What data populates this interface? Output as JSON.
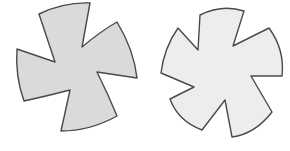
{
  "figure": {
    "width": 290,
    "height": 151,
    "background": "#ffffff",
    "stroke_color": "#4a4a4a",
    "stroke_width": 1.4
  },
  "shapes": [
    {
      "name": "four-arm-pinwheel",
      "arms": 4,
      "fill": "#dadada",
      "path": "M39,14 Q64,2 90,3 L82,47 Q101,31 117,22 Q134,50 137,78 L97,72 Q108,94 117,116 Q90,131 61,131 L70,90 Q47,96 24,101 Q15,76 17,49 L55,62 Z"
    },
    {
      "name": "five-arm-pinwheel",
      "arms": 5,
      "fill": "#ededed",
      "path": "M200,15 Q222,4 244,11 L233,46 L269,28 Q285,50 282,76 L251,76 L272,112 Q255,134 232,137 L225,100 L202,130 Q178,121 170,99 L194,87 L161,73 Q164,48 178,28 L198,50 Z"
    }
  ]
}
